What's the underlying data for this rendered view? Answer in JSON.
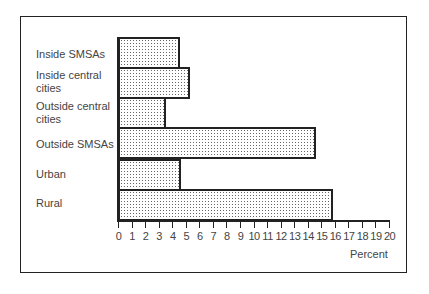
{
  "chart_data": {
    "type": "bar",
    "orientation": "horizontal",
    "title": "",
    "categories": [
      "Inside SMSAs",
      "Inside central cities",
      "Outside central cities",
      "Outside SMSAs",
      "Urban",
      "Rural"
    ],
    "values": [
      4.4,
      5.2,
      3.4,
      14.5,
      4.5,
      15.7
    ],
    "xlabel": "Percent",
    "ylabel": "",
    "xlim": [
      0,
      20
    ],
    "xticks": [
      "0",
      "1",
      "2",
      "3",
      "4",
      "5",
      "6",
      "7",
      "8",
      "9",
      "10",
      "11",
      "12",
      "13",
      "14",
      "15",
      "16",
      "17",
      "18",
      "19",
      "20"
    ],
    "grid": false,
    "legend": null,
    "bar_fill": "stippled dots",
    "bar_border_color": "#222222"
  },
  "labels": [
    {
      "line1": "Inside SMSAs",
      "line2": ""
    },
    {
      "line1": "Inside central",
      "line2": "cities"
    },
    {
      "line1": "Outside central",
      "line2": "cities"
    },
    {
      "line1": "Outside SMSAs",
      "line2": ""
    },
    {
      "line1": "Urban",
      "line2": ""
    },
    {
      "line1": "Rural",
      "line2": ""
    }
  ]
}
